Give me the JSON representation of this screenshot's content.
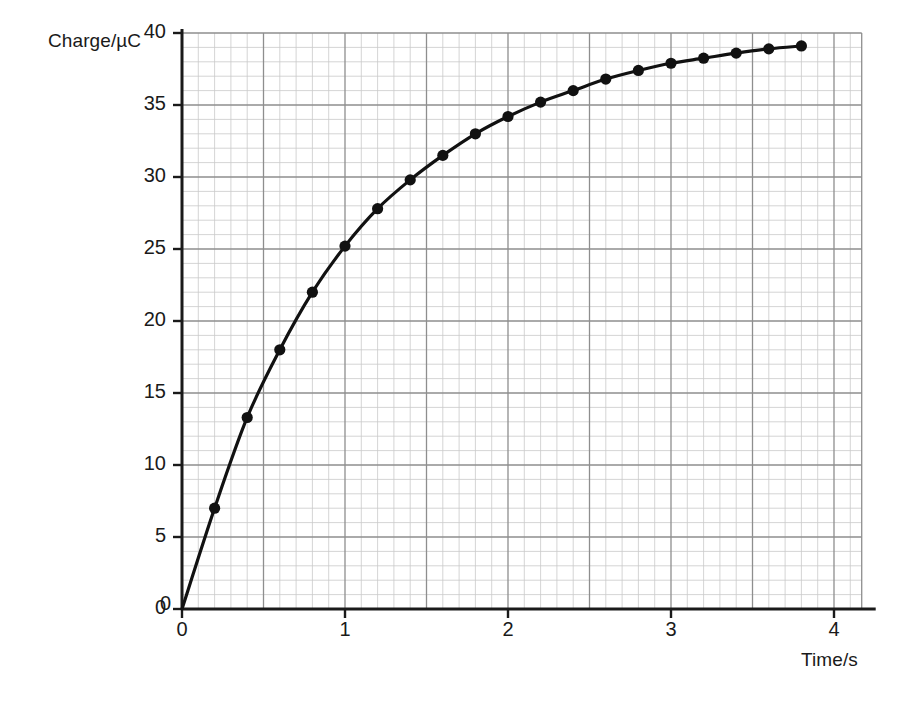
{
  "chart_data": {
    "type": "line",
    "title": "",
    "xlabel": "Time/s",
    "ylabel": "Charge/µC",
    "xlim": [
      0,
      4.17
    ],
    "ylim": [
      0,
      40
    ],
    "xticks": [
      "0",
      "1",
      "2",
      "3",
      "4"
    ],
    "xtick_values": [
      0,
      1,
      2,
      3,
      4
    ],
    "yticks": [
      "0",
      "5",
      "10",
      "15",
      "20",
      "25",
      "30",
      "35",
      "40"
    ],
    "ytick_values": [
      0,
      5,
      10,
      15,
      20,
      25,
      30,
      35,
      40
    ],
    "grid": true,
    "grid_minor_x_step": 0.1,
    "grid_minor_y_step": 1,
    "grid_major_x_step": 0.5,
    "grid_major_y_step": 5,
    "legend": null,
    "marker": "filled-circle",
    "line_color": "#111111",
    "marker_color": "#111111",
    "grid_minor_color": "#c9c9c9",
    "grid_major_color": "#8e8e8e",
    "axis_color": "#1a1a1a",
    "background_color": "#ffffff",
    "x": [
      0,
      0.2,
      0.4,
      0.6,
      0.8,
      1.0,
      1.2,
      1.4,
      1.6,
      1.8,
      2.0,
      2.2,
      2.4,
      2.6,
      2.8,
      3.0,
      3.2,
      3.4,
      3.6,
      3.8
    ],
    "values": [
      0,
      7.0,
      13.3,
      18.0,
      22.0,
      25.2,
      27.8,
      29.8,
      31.5,
      33.0,
      34.2,
      35.2,
      36.0,
      36.8,
      37.4,
      37.9,
      38.25,
      38.6,
      38.9,
      39.1
    ],
    "series": [
      {
        "name": "Charge",
        "values": [
          0,
          7.0,
          13.3,
          18.0,
          22.0,
          25.2,
          27.8,
          29.8,
          31.5,
          33.0,
          34.2,
          35.2,
          36.0,
          36.8,
          37.4,
          37.9,
          38.25,
          38.6,
          38.9,
          39.1
        ]
      }
    ]
  },
  "labels": {
    "y_axis_title": "Charge/µC",
    "x_axis_title": "Time/s",
    "origin_y_zero": "0",
    "origin_x_zero": "0"
  }
}
